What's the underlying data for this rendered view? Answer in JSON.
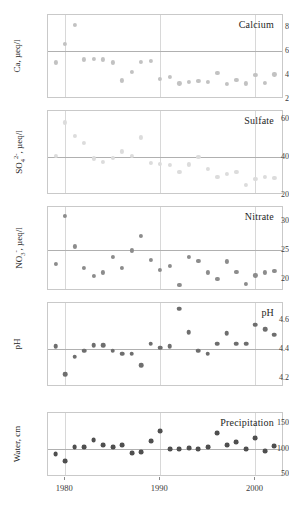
{
  "figure": {
    "x_axis": {
      "ticks": [
        1980,
        1990,
        2000
      ],
      "tick_labels": [
        "1980",
        "1990",
        "2000"
      ],
      "range": [
        1978.2,
        2003.0
      ],
      "gridlines": true
    }
  },
  "chart_data": [
    {
      "type": "scatter",
      "title": "Calcium",
      "xlabel": "",
      "ylabel": "Ca, µeq/l",
      "ylabel_html": "Ca, µeq/l",
      "ylim": [
        2.0,
        9.0
      ],
      "yticks": [
        2,
        4,
        6,
        8
      ],
      "ytick_labels": [
        "2",
        "4",
        "6",
        "8"
      ],
      "reference_line": 6,
      "marker_color": "#c2c2c2",
      "marker_size": 4.2,
      "x": [
        1979,
        1980,
        1981,
        1982,
        1983,
        1984,
        1985,
        1986,
        1987,
        1988,
        1989,
        1990,
        1991,
        1992,
        1993,
        1994,
        1995,
        1996,
        1997,
        1998,
        1999,
        2000,
        2001,
        2002
      ],
      "y": [
        5.05,
        6.6,
        8.15,
        5.3,
        5.35,
        5.3,
        5.05,
        3.55,
        4.25,
        5.1,
        5.2,
        3.7,
        3.85,
        3.3,
        3.45,
        3.5,
        3.45,
        4.15,
        3.25,
        3.6,
        3.3,
        4.0,
        3.35,
        4.05
      ]
    },
    {
      "type": "scatter",
      "title": "Sulfate",
      "xlabel": "",
      "ylabel": "SO4 2-, µeq/l",
      "ylim": [
        20.0,
        64.0
      ],
      "yticks": [
        20,
        40,
        60
      ],
      "ytick_labels": [
        "20",
        "40",
        "60"
      ],
      "reference_line": 40,
      "marker_color": "#dcdcdc",
      "marker_size": 4.2,
      "x": [
        1979,
        1980,
        1981,
        1982,
        1983,
        1984,
        1985,
        1986,
        1987,
        1988,
        1989,
        1990,
        1991,
        1992,
        1993,
        1994,
        1995,
        1996,
        1997,
        1998,
        1999,
        2000,
        2001,
        2002
      ],
      "y": [
        40.3,
        58.0,
        51.0,
        47.5,
        39.2,
        37.4,
        39.6,
        42.8,
        40.3,
        50.2,
        37.0,
        36.2,
        35.6,
        32.0,
        36.0,
        40.0,
        33.5,
        29.5,
        31.0,
        32.0,
        25.5,
        28.5,
        29.5,
        28.8
      ]
    },
    {
      "type": "scatter",
      "title": "Nitrate",
      "xlabel": "",
      "ylabel": "NO3 -, µeq/l",
      "ylim": [
        18.0,
        32.5
      ],
      "yticks": [
        20,
        25,
        30
      ],
      "ytick_labels": [
        "20",
        "25",
        "30"
      ],
      "reference_line": 25,
      "marker_color": "#8c8c8c",
      "marker_size": 4.2,
      "x": [
        1979,
        1980,
        1981,
        1982,
        1983,
        1984,
        1985,
        1986,
        1987,
        1988,
        1989,
        1990,
        1991,
        1992,
        1993,
        1994,
        1995,
        1996,
        1997,
        1998,
        1999,
        2000,
        2001,
        2002
      ],
      "y": [
        22.7,
        30.9,
        25.7,
        22.0,
        20.6,
        21.2,
        23.9,
        22.0,
        25.0,
        27.5,
        23.3,
        21.7,
        22.3,
        19.0,
        23.9,
        23.2,
        21.2,
        20.1,
        23.1,
        21.3,
        19.2,
        20.7,
        21.2,
        21.5
      ]
    },
    {
      "type": "scatter",
      "title": "pH",
      "xlabel": "",
      "ylabel": "pH",
      "ylim": [
        4.14,
        4.72
      ],
      "yticks": [
        4.2,
        4.4,
        4.6
      ],
      "ytick_labels": [
        "4.2",
        "4.4",
        "4.6"
      ],
      "reference_line": 4.4,
      "marker_color": "#6e6e6e",
      "marker_size": 4.6,
      "x": [
        1979,
        1980,
        1981,
        1982,
        1983,
        1984,
        1985,
        1986,
        1987,
        1988,
        1989,
        1990,
        1991,
        1992,
        1993,
        1994,
        1995,
        1996,
        1997,
        1998,
        1999,
        2000,
        2001,
        2002
      ],
      "y": [
        4.42,
        4.23,
        4.35,
        4.39,
        4.43,
        4.43,
        4.39,
        4.37,
        4.37,
        4.29,
        4.44,
        4.41,
        4.42,
        4.68,
        4.52,
        4.39,
        4.37,
        4.44,
        4.51,
        4.44,
        4.44,
        4.57,
        4.54,
        4.5
      ]
    },
    {
      "type": "scatter",
      "title": "Precipitation",
      "xlabel": "",
      "ylabel": "Water, cm",
      "ylim": [
        45.0,
        170.0
      ],
      "yticks": [
        50,
        100,
        150
      ],
      "ytick_labels": [
        "50",
        "100",
        "150"
      ],
      "reference_line": 100,
      "marker_color": "#4f4f4f",
      "marker_size": 4.8,
      "x": [
        1979,
        1980,
        1981,
        1982,
        1983,
        1984,
        1985,
        1986,
        1987,
        1988,
        1989,
        1990,
        1991,
        1992,
        1993,
        1994,
        1995,
        1996,
        1997,
        1998,
        1999,
        2000,
        2001,
        2002
      ],
      "y": [
        90,
        76,
        103,
        104,
        117,
        107,
        103,
        108,
        92,
        94,
        115,
        135,
        100,
        100,
        102,
        100,
        104,
        130,
        108,
        113,
        99,
        121,
        95,
        106
      ]
    }
  ]
}
